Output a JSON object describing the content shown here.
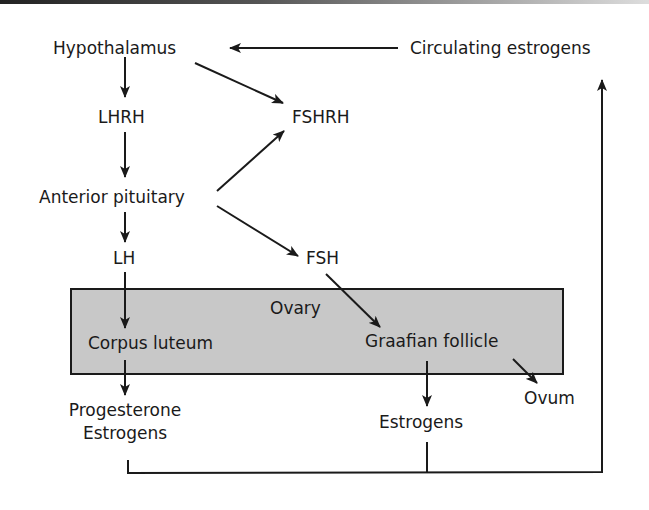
{
  "diagram": {
    "nodes": {
      "hypothalamus": "Hypothalamus",
      "circulating_estrogens": "Circulating estrogens",
      "lhrh": "LHRH",
      "fshrh": "FSHRH",
      "anterior_pituitary": "Anterior pituitary",
      "lh": "LH",
      "fsh": "FSH",
      "ovary": "Ovary",
      "corpus_luteum": "Corpus luteum",
      "graafian_follicle": "Graafian follicle",
      "progesterone": "Progesterone",
      "estrogens_cl": "Estrogens",
      "estrogens_gf": "Estrogens",
      "ovum": "Ovum"
    },
    "edges": [
      {
        "from": "Hypothalamus",
        "to": "LHRH"
      },
      {
        "from": "Hypothalamus",
        "to": "FSHRH"
      },
      {
        "from": "Circulating estrogens",
        "to": "Hypothalamus"
      },
      {
        "from": "LHRH",
        "to": "Anterior pituitary"
      },
      {
        "from": "Anterior pituitary",
        "to": "FSHRH"
      },
      {
        "from": "Anterior pituitary",
        "to": "LH"
      },
      {
        "from": "Anterior pituitary",
        "to": "FSH"
      },
      {
        "from": "LH",
        "to": "Corpus luteum"
      },
      {
        "from": "FSH",
        "to": "Graafian follicle"
      },
      {
        "from": "Corpus luteum",
        "to": "Progesterone / Estrogens"
      },
      {
        "from": "Graafian follicle",
        "to": "Estrogens"
      },
      {
        "from": "Graafian follicle",
        "to": "Ovum"
      },
      {
        "from": "Progesterone / Estrogens + Estrogens",
        "to": "Circulating estrogens"
      }
    ],
    "colors": {
      "ovary_fill": "#c8c8c8",
      "line": "#1a1a1a"
    }
  }
}
